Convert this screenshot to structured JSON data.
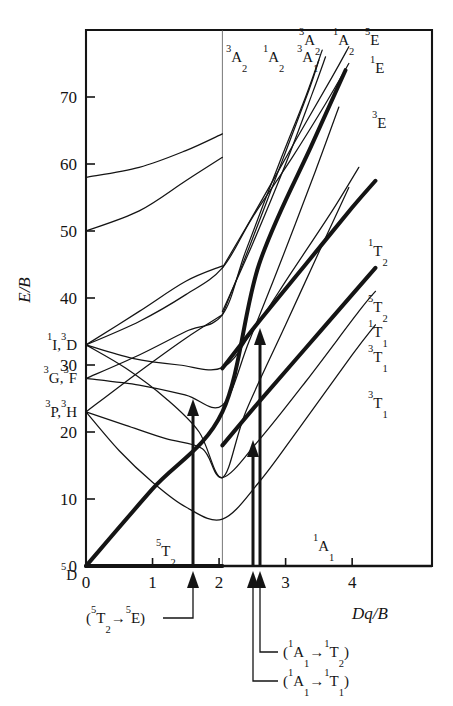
{
  "figure": {
    "kind": "tanabe-sugano-diagram",
    "frame": {
      "x0": 86,
      "y0": 30,
      "x1": 432,
      "y1": 566
    }
  },
  "axes": {
    "y_title": "E/B",
    "x_title": "Dq/B",
    "x_ticks": [
      "0",
      "1",
      "2",
      "3",
      "4"
    ],
    "x_tick_values": [
      0,
      1,
      2,
      3,
      4
    ],
    "y_ticks": [
      "0",
      "10",
      "20",
      "30",
      "40",
      "50",
      "60",
      "70"
    ],
    "y_tick_values": [
      0,
      10,
      20,
      30,
      40,
      50,
      60,
      70
    ],
    "xlim": [
      0,
      5.2
    ],
    "ylim": [
      0,
      80
    ]
  },
  "free_ion_terms": [
    {
      "label": "¹I, ³D",
      "parts": [
        {
          "t": "sup",
          "v": "1"
        },
        {
          "t": "txt",
          "v": "I,"
        },
        {
          "t": "sup",
          "v": "3"
        },
        {
          "t": "txt",
          "v": "D"
        }
      ],
      "value": 33.0
    },
    {
      "label": "³G, ³F",
      "parts": [
        {
          "t": "sup",
          "v": "3"
        },
        {
          "t": "txt",
          "v": "G,"
        },
        {
          "t": "sup",
          "v": "3"
        },
        {
          "t": "txt",
          "v": "F"
        }
      ],
      "value": 28.0
    },
    {
      "label": "³P, ³H",
      "parts": [
        {
          "t": "sup",
          "v": "3"
        },
        {
          "t": "txt",
          "v": "P,"
        },
        {
          "t": "sup",
          "v": "3"
        },
        {
          "t": "txt",
          "v": "H"
        }
      ],
      "value": 23.0
    },
    {
      "label": "⁵D",
      "parts": [
        {
          "t": "sup",
          "v": "5"
        },
        {
          "t": "txt",
          "v": "D"
        }
      ],
      "value": 0.0
    }
  ],
  "top_labels": [
    {
      "label": "³A₂",
      "parts": [
        {
          "t": "sup",
          "v": "3"
        },
        {
          "t": "txt",
          "v": "A"
        },
        {
          "t": "sub",
          "v": "2"
        }
      ],
      "x": 226,
      "y": 62
    },
    {
      "label": "¹A₂",
      "parts": [
        {
          "t": "sup",
          "v": "1"
        },
        {
          "t": "txt",
          "v": "A"
        },
        {
          "t": "sub",
          "v": "2"
        }
      ],
      "x": 263,
      "y": 62
    },
    {
      "label": "³A₁",
      "parts": [
        {
          "t": "sup",
          "v": "3"
        },
        {
          "t": "txt",
          "v": "A"
        },
        {
          "t": "sub",
          "v": "1"
        }
      ],
      "x": 297,
      "y": 62
    },
    {
      "label": "³A₂",
      "parts": [
        {
          "t": "sup",
          "v": "3"
        },
        {
          "t": "txt",
          "v": "A"
        },
        {
          "t": "sub",
          "v": "2"
        }
      ],
      "x": 299,
      "y": 45
    },
    {
      "label": "¹A₂",
      "parts": [
        {
          "t": "sup",
          "v": "1"
        },
        {
          "t": "txt",
          "v": "A"
        },
        {
          "t": "sub",
          "v": "2"
        }
      ],
      "x": 333,
      "y": 45
    },
    {
      "label": "⁵E",
      "parts": [
        {
          "t": "sup",
          "v": "5"
        },
        {
          "t": "txt",
          "v": "E"
        }
      ],
      "x": 365,
      "y": 45
    },
    {
      "label": "¹E",
      "parts": [
        {
          "t": "sup",
          "v": "1"
        },
        {
          "t": "txt",
          "v": "E"
        }
      ],
      "x": 370,
      "y": 73
    },
    {
      "label": "³E",
      "parts": [
        {
          "t": "sup",
          "v": "3"
        },
        {
          "t": "txt",
          "v": "E"
        }
      ],
      "x": 372,
      "y": 128
    }
  ],
  "right_labels": [
    {
      "label": "¹T₂",
      "parts": [
        {
          "t": "sup",
          "v": "1"
        },
        {
          "t": "txt",
          "v": "T"
        },
        {
          "t": "sub",
          "v": "2"
        }
      ],
      "x": 368,
      "y": 256
    },
    {
      "label": "⁵T₂",
      "parts": [
        {
          "t": "sup",
          "v": "5"
        },
        {
          "t": "txt",
          "v": "T"
        },
        {
          "t": "sub",
          "v": "2"
        }
      ],
      "x": 368,
      "y": 312
    },
    {
      "label": "¹T₁",
      "parts": [
        {
          "t": "sup",
          "v": "1"
        },
        {
          "t": "txt",
          "v": "T"
        },
        {
          "t": "sub",
          "v": "1"
        }
      ],
      "x": 368,
      "y": 337
    },
    {
      "label": "³T₁",
      "parts": [
        {
          "t": "sup",
          "v": "3"
        },
        {
          "t": "txt",
          "v": "T"
        },
        {
          "t": "sub",
          "v": "1"
        }
      ],
      "x": 368,
      "y": 362
    },
    {
      "label": "³T₁",
      "parts": [
        {
          "t": "sup",
          "v": "3"
        },
        {
          "t": "txt",
          "v": "T"
        },
        {
          "t": "sub",
          "v": "1"
        }
      ],
      "x": 368,
      "y": 408
    }
  ],
  "inline_labels": [
    {
      "label": "⁵T₂",
      "parts": [
        {
          "t": "sup",
          "v": "5"
        },
        {
          "t": "txt",
          "v": "T"
        },
        {
          "t": "sub",
          "v": "2"
        }
      ],
      "x": 156,
      "y": 556
    },
    {
      "label": "¹A₁",
      "parts": [
        {
          "t": "sup",
          "v": "1"
        },
        {
          "t": "txt",
          "v": "A"
        },
        {
          "t": "sub",
          "v": "1"
        }
      ],
      "x": 313,
      "y": 551
    }
  ],
  "annotations": [
    {
      "id": "transition-5T2-5E",
      "label": "(⁵T₂→⁵E)",
      "parts": [
        {
          "t": "txt",
          "v": "("
        },
        {
          "t": "sup",
          "v": "5"
        },
        {
          "t": "txt",
          "v": "T"
        },
        {
          "t": "sub",
          "v": "2"
        },
        {
          "t": "txt",
          "v": "→"
        },
        {
          "t": "sup",
          "v": "5"
        },
        {
          "t": "txt",
          "v": "E)"
        }
      ],
      "text_x": 86,
      "text_y": 623,
      "arrow_x": 193,
      "arrow_top": 399,
      "arrow_bottom": 566,
      "leader": "M 163 618 L 193 618 L 193 578"
    },
    {
      "id": "transition-1A1-1T2",
      "label": "(¹A₁→¹T₂)",
      "parts": [
        {
          "t": "txt",
          "v": "("
        },
        {
          "t": "sup",
          "v": "1"
        },
        {
          "t": "txt",
          "v": "A"
        },
        {
          "t": "sub",
          "v": "1"
        },
        {
          "t": "txt",
          "v": "→"
        },
        {
          "t": "sup",
          "v": "1"
        },
        {
          "t": "txt",
          "v": "T"
        },
        {
          "t": "sub",
          "v": "2"
        },
        {
          "t": "txt",
          "v": ")"
        }
      ],
      "text_x": 283,
      "text_y": 657,
      "arrow_x": 260,
      "arrow_top": 328,
      "arrow_bottom": 566,
      "leader": "M 278 652 L 260 652 L 260 578"
    },
    {
      "id": "transition-1A1-1T1",
      "label": "(¹A₁→¹T₁)",
      "parts": [
        {
          "t": "txt",
          "v": "("
        },
        {
          "t": "sup",
          "v": "1"
        },
        {
          "t": "txt",
          "v": "A"
        },
        {
          "t": "sub",
          "v": "1"
        },
        {
          "t": "txt",
          "v": "→"
        },
        {
          "t": "sup",
          "v": "1"
        },
        {
          "t": "txt",
          "v": "T"
        },
        {
          "t": "sub",
          "v": "1"
        },
        {
          "t": "txt",
          "v": ")"
        }
      ],
      "text_x": 283,
      "text_y": 686,
      "arrow_x": 253,
      "arrow_top": 440,
      "arrow_bottom": 566,
      "leader": "M 278 681 L 253 681 L 253 578"
    }
  ],
  "colors": {
    "line": "#141414",
    "background": "#ffffff",
    "crossover_rule": "#555555",
    "text": "#141414"
  },
  "chart_data": {
    "type": "line",
    "title": "",
    "xlabel": "Dq/B",
    "ylabel": "E/B",
    "xlim": [
      0,
      5.2
    ],
    "ylim": [
      0,
      80
    ],
    "grid": false,
    "legend": "inline-term-labels",
    "crossover_x": 2.05,
    "series": [
      {
        "name": "⁵T₂ ground state",
        "weight": "thick",
        "points": [
          [
            0,
            0
          ],
          [
            2.05,
            0
          ]
        ]
      },
      {
        "name": "¹A₁ ground state",
        "weight": "thin",
        "points": [
          [
            2.05,
            0
          ],
          [
            5.2,
            0
          ]
        ]
      },
      {
        "name": "⁵E (rises from ⁵D, becomes excited above crossover)",
        "weight": "thick",
        "points": [
          [
            0,
            0
          ],
          [
            1.0,
            11.5
          ],
          [
            2.05,
            23.0
          ],
          [
            2.6,
            45.0
          ],
          [
            3.4,
            63.0
          ],
          [
            3.9,
            74.0
          ]
        ]
      },
      {
        "name": "³T₁ (lowest triplet, from ³H)",
        "weight": "thin",
        "points": [
          [
            0,
            23.0
          ],
          [
            0.5,
            17.2
          ],
          [
            1.0,
            12.5
          ],
          [
            1.5,
            8.8
          ],
          [
            2.05,
            7.0
          ],
          [
            2.6,
            12.5
          ],
          [
            3.2,
            20.5
          ],
          [
            4.0,
            31.5
          ],
          [
            4.35,
            36.0
          ]
        ]
      },
      {
        "name": "³T₂ (from ³H)",
        "weight": "thin",
        "points": [
          [
            0,
            23.0
          ],
          [
            0.6,
            21.0
          ],
          [
            1.2,
            19.0
          ],
          [
            1.75,
            17.5
          ],
          [
            2.05,
            13.2
          ],
          [
            2.6,
            18.8
          ],
          [
            3.3,
            27.5
          ],
          [
            4.1,
            38.0
          ],
          [
            4.35,
            41.0
          ]
        ]
      },
      {
        "name": "¹T₂ (spin-forbidden, emphasised)",
        "weight": "thick",
        "points": [
          [
            2.05,
            29.5
          ],
          [
            2.6,
            36.5
          ],
          [
            3.3,
            45.0
          ],
          [
            4.0,
            53.5
          ],
          [
            4.35,
            57.5
          ]
        ]
      },
      {
        "name": "¹T₁ (spin-forbidden, emphasised)",
        "weight": "thick",
        "points": [
          [
            2.05,
            18.0
          ],
          [
            2.6,
            24.5
          ],
          [
            3.3,
            32.5
          ],
          [
            4.0,
            40.5
          ],
          [
            4.35,
            44.5
          ]
        ]
      },
      {
        "name": "¹A₁ upper branch (from ¹I)",
        "weight": "thin",
        "points": [
          [
            0,
            33.0
          ],
          [
            0.6,
            29.5
          ],
          [
            1.2,
            25.0
          ],
          [
            1.7,
            20.0
          ],
          [
            2.05,
            13.2
          ],
          [
            2.4,
            23.0
          ],
          [
            3.0,
            36.0
          ],
          [
            3.6,
            49.0
          ],
          [
            3.95,
            56.5
          ]
        ]
      },
      {
        "name": "¹T₁ (from ¹I)",
        "weight": "thin",
        "points": [
          [
            0,
            33.0
          ],
          [
            0.7,
            31.0
          ],
          [
            1.4,
            30.0
          ],
          [
            2.05,
            29.6
          ],
          [
            2.5,
            35.0
          ],
          [
            3.1,
            44.0
          ],
          [
            3.7,
            53.0
          ],
          [
            4.1,
            59.5
          ]
        ]
      },
      {
        "name": "³E (from ³D)",
        "weight": "thin",
        "points": [
          [
            0,
            33.0
          ],
          [
            0.8,
            36.5
          ],
          [
            1.5,
            40.5
          ],
          [
            2.05,
            44.5
          ],
          [
            2.5,
            52.0
          ],
          [
            3.1,
            61.0
          ],
          [
            3.6,
            69.0
          ],
          [
            3.95,
            75.0
          ]
        ]
      },
      {
        "name": "³A₂ (from ³F)",
        "weight": "thin",
        "points": [
          [
            0,
            28.0
          ],
          [
            0.8,
            31.5
          ],
          [
            1.5,
            35.0
          ],
          [
            2.05,
            37.5
          ],
          [
            2.4,
            47.0
          ],
          [
            2.9,
            60.0
          ],
          [
            3.3,
            70.0
          ],
          [
            3.55,
            77.0
          ]
        ]
      },
      {
        "name": "¹A₂ (from ¹G)",
        "weight": "thin",
        "points": [
          [
            0,
            28.0
          ],
          [
            0.8,
            27.0
          ],
          [
            1.5,
            25.5
          ],
          [
            2.05,
            24.0
          ],
          [
            2.45,
            33.5
          ],
          [
            2.95,
            46.0
          ],
          [
            3.45,
            59.0
          ],
          [
            3.8,
            68.5
          ]
        ]
      },
      {
        "name": "³A₁ (upper)",
        "weight": "thin",
        "points": [
          [
            2.05,
            38.0
          ],
          [
            2.5,
            48.0
          ],
          [
            3.0,
            60.0
          ],
          [
            3.4,
            70.5
          ],
          [
            3.6,
            76.0
          ]
        ]
      },
      {
        "name": "¹A₂ (upper, steep)",
        "weight": "thin",
        "points": [
          [
            2.05,
            37.5
          ],
          [
            2.45,
            47.5
          ],
          [
            2.95,
            60.5
          ],
          [
            3.35,
            71.0
          ],
          [
            3.5,
            75.5
          ]
        ]
      },
      {
        "name": "¹E (upper)",
        "weight": "thin",
        "points": [
          [
            2.05,
            44.5
          ],
          [
            2.55,
            53.0
          ],
          [
            3.15,
            63.5
          ],
          [
            3.7,
            73.0
          ],
          [
            3.95,
            77.5
          ]
        ]
      },
      {
        "name": "⁵E upper branch",
        "weight": "thin",
        "points": [
          [
            0,
            58.0
          ],
          [
            0.8,
            59.5
          ],
          [
            1.5,
            62.0
          ],
          [
            2.05,
            64.5
          ]
        ]
      },
      {
        "name": "¹E lower-field branch",
        "weight": "thin",
        "points": [
          [
            0,
            50.0
          ],
          [
            0.8,
            53.0
          ],
          [
            1.5,
            57.5
          ],
          [
            2.05,
            61.0
          ]
        ]
      },
      {
        "name": "¹T₂ low-field branch",
        "weight": "thin",
        "points": [
          [
            0,
            33.0
          ],
          [
            0.8,
            38.0
          ],
          [
            1.5,
            42.5
          ],
          [
            2.05,
            44.8
          ]
        ]
      },
      {
        "name": "³T₂ mid branch",
        "weight": "thin",
        "points": [
          [
            0,
            23.0
          ],
          [
            0.8,
            29.0
          ],
          [
            1.5,
            34.0
          ],
          [
            2.05,
            37.5
          ]
        ]
      }
    ]
  }
}
